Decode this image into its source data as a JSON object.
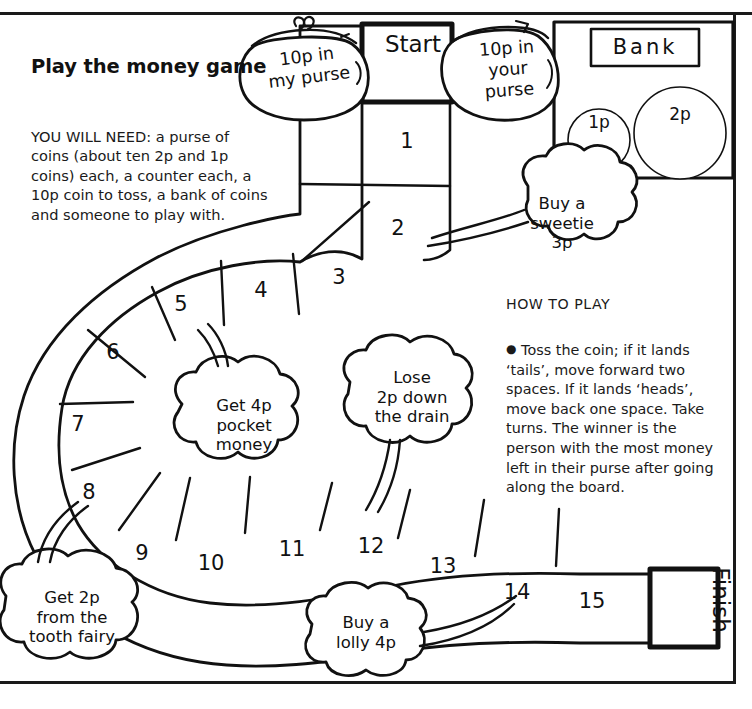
{
  "page": {
    "title": "Play the money game"
  },
  "you_will_need": {
    "text": "YOU WILL NEED: a purse of coins (about ten 2p and 1p coins) each, a counter each, a 10p coin to toss, a bank of coins and someone to play with."
  },
  "how_to_play": {
    "heading": "HOW TO PLAY",
    "bullet": "●",
    "body": "Toss the coin; if it lands ‘tails’, move forward two spaces. If it lands ‘heads’, move back one space. Take turns. The winner is the person with the most money left in their purse after going along the board."
  },
  "bank": {
    "title": "Bank",
    "coins": [
      {
        "label": "1p"
      },
      {
        "label": "2p"
      }
    ]
  },
  "purses": [
    {
      "id": "my-purse",
      "line1": "10p in",
      "line2": "my purse"
    },
    {
      "id": "your-purse",
      "line1": "10p in",
      "line2": "your",
      "line3": "purse"
    }
  ],
  "board": {
    "start_label": "Start",
    "finish_label": "Finish",
    "cells": [
      {
        "number": "1",
        "x": 407,
        "y": 141
      },
      {
        "number": "2",
        "x": 398,
        "y": 228
      },
      {
        "number": "3",
        "x": 339,
        "y": 277
      },
      {
        "number": "4",
        "x": 261,
        "y": 290
      },
      {
        "number": "5",
        "x": 181,
        "y": 304
      },
      {
        "number": "6",
        "x": 113,
        "y": 352
      },
      {
        "number": "7",
        "x": 78,
        "y": 424
      },
      {
        "number": "8",
        "x": 89,
        "y": 492
      },
      {
        "number": "9",
        "x": 142,
        "y": 553
      },
      {
        "number": "10",
        "x": 211,
        "y": 563
      },
      {
        "number": "11",
        "x": 292,
        "y": 549
      },
      {
        "number": "12",
        "x": 371,
        "y": 546
      },
      {
        "number": "13",
        "x": 443,
        "y": 566
      },
      {
        "number": "14",
        "x": 517,
        "y": 592
      },
      {
        "number": "15",
        "x": 592,
        "y": 601
      }
    ]
  },
  "clouds": [
    {
      "id": "sweetie",
      "lines": [
        "Buy a",
        "sweetie",
        "3p"
      ]
    },
    {
      "id": "pocket-money",
      "lines": [
        "Get 4p",
        "pocket",
        "money"
      ]
    },
    {
      "id": "drain",
      "lines": [
        "Lose",
        "2p down",
        "the drain"
      ]
    },
    {
      "id": "tooth-fairy",
      "lines": [
        "Get 2p",
        "from the",
        "tooth fairy"
      ]
    },
    {
      "id": "lolly",
      "lines": [
        "Buy a",
        "lolly 4p"
      ]
    }
  ],
  "colors": {
    "ink": "#111111",
    "paper": "#ffffff"
  }
}
